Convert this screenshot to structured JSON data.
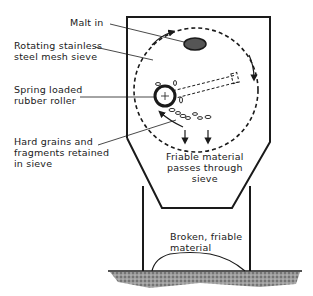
{
  "diagram": {
    "type": "schematic",
    "labels": {
      "malt_in": "Malt in",
      "sieve": "Rotating stainless\nsteel mesh sieve",
      "roller": "Spring loaded\nrubber roller",
      "retained": "Hard grains and\nfragments retained\nin sieve",
      "passes": "Friable material\npasses through\nsieve",
      "broken": "Broken, friable\nmaterial"
    },
    "colors": {
      "line": "#1a1a1a",
      "background": "#ffffff",
      "malt_fill": "#555555"
    }
  }
}
